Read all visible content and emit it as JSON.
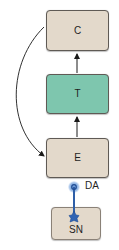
{
  "diagram": {
    "nodes": {
      "c": {
        "label": "C",
        "fill": "#e3d9cb"
      },
      "t": {
        "label": "T",
        "fill": "#7ec6ae"
      },
      "e": {
        "label": "E",
        "fill": "#e3d9cb"
      },
      "sn": {
        "label": "SN",
        "fill": "#e3d9cb"
      }
    },
    "neuron": {
      "label": "DA",
      "color": "#2f5fa8",
      "glow": "#7aa6de"
    },
    "edges": [
      {
        "from": "T",
        "to": "C",
        "type": "straight-arrow"
      },
      {
        "from": "E",
        "to": "T",
        "type": "straight-arrow"
      },
      {
        "from": "C",
        "to": "E",
        "type": "curved-arrow"
      },
      {
        "from": "SN",
        "to": "E",
        "type": "DA-projection"
      }
    ]
  }
}
